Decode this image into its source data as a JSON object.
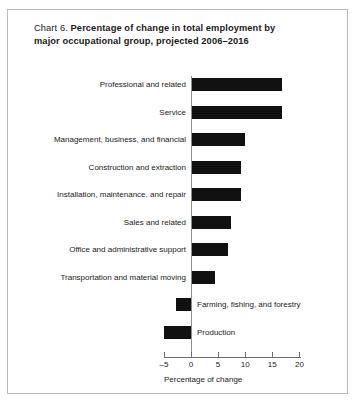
{
  "chart": {
    "title_prefix": "Chart 6.",
    "title_line1": "Percentage of change in total employment by",
    "title_line2": "major occupational group, projected 2006–2016",
    "x_axis_title": "Percentage of change"
  },
  "chart_data": {
    "type": "bar",
    "orientation": "horizontal",
    "title": "Chart 6. Percentage of change in total employment by major occupational group, projected 2006–2016",
    "xlabel": "Percentage of change",
    "ylabel": "",
    "xlim": [
      -5,
      20
    ],
    "xticks": [
      -5,
      0,
      5,
      10,
      15,
      20
    ],
    "xticklabels": [
      "–5",
      "0",
      "5",
      "10",
      "15",
      "20"
    ],
    "grid": false,
    "legend": null,
    "bar_color": "#111111",
    "categories": [
      "Professional and related",
      "Service",
      "Management, business, and financial",
      "Construction and extraction",
      "Installation, maintenance, and repair",
      "Sales and related",
      "Office and administrative support",
      "Transportation and material moving",
      "Farming, fishing, and forestry",
      "Production"
    ],
    "values": [
      16.7,
      16.7,
      10.0,
      9.3,
      9.2,
      7.4,
      6.9,
      4.5,
      -2.8,
      -4.9
    ]
  }
}
